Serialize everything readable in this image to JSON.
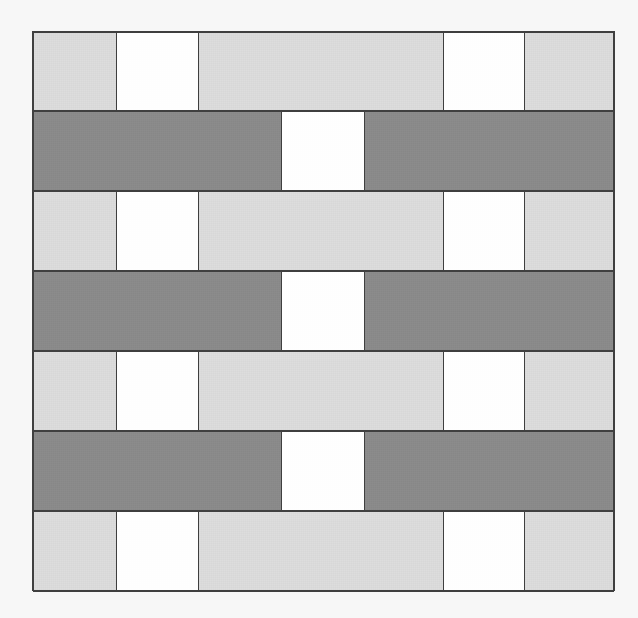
{
  "figure": {
    "type": "tiling-pattern-grid",
    "canvas_width": 638,
    "canvas_height": 618,
    "background_color": "#f7f7f7",
    "grid_left": 33,
    "grid_top": 32,
    "grid_width": 581,
    "grid_height": 560,
    "row_count": 7,
    "border_color": "#3f3f3f"
  },
  "palette": {
    "light_gray": "#dcdcdc",
    "dark_gray": "#8a8a8a",
    "white": "#ffffff",
    "outline": "#3f3f3f",
    "page_background": "#f7f7f7"
  },
  "legend": {
    "light_gray_label": "light gray tile",
    "dark_gray_label": "dark gray tile",
    "white_label": "white tile"
  },
  "rows": [
    {
      "index": 1,
      "band": "light",
      "cells": [
        {
          "fill": "light",
          "width_units": 84,
          "color": "#dcdcdc"
        },
        {
          "fill": "white",
          "width_units": 81,
          "color": "#ffffff"
        },
        {
          "fill": "light",
          "width_units": 246,
          "color": "#dcdcdc"
        },
        {
          "fill": "white",
          "width_units": 81,
          "color": "#ffffff"
        },
        {
          "fill": "light",
          "width_units": 89,
          "color": "#dcdcdc"
        }
      ]
    },
    {
      "index": 2,
      "band": "dark",
      "cells": [
        {
          "fill": "dark",
          "width_units": 249,
          "color": "#8a8a8a"
        },
        {
          "fill": "white",
          "width_units": 82,
          "color": "#ffffff"
        },
        {
          "fill": "dark",
          "width_units": 250,
          "color": "#8a8a8a"
        }
      ]
    },
    {
      "index": 3,
      "band": "light",
      "cells": [
        {
          "fill": "light",
          "width_units": 84,
          "color": "#dcdcdc"
        },
        {
          "fill": "white",
          "width_units": 81,
          "color": "#ffffff"
        },
        {
          "fill": "light",
          "width_units": 246,
          "color": "#dcdcdc"
        },
        {
          "fill": "white",
          "width_units": 81,
          "color": "#ffffff"
        },
        {
          "fill": "light",
          "width_units": 89,
          "color": "#dcdcdc"
        }
      ]
    },
    {
      "index": 4,
      "band": "dark",
      "cells": [
        {
          "fill": "dark",
          "width_units": 249,
          "color": "#8a8a8a"
        },
        {
          "fill": "white",
          "width_units": 82,
          "color": "#ffffff"
        },
        {
          "fill": "dark",
          "width_units": 250,
          "color": "#8a8a8a"
        }
      ]
    },
    {
      "index": 5,
      "band": "light",
      "cells": [
        {
          "fill": "light",
          "width_units": 84,
          "color": "#dcdcdc"
        },
        {
          "fill": "white",
          "width_units": 81,
          "color": "#ffffff"
        },
        {
          "fill": "light",
          "width_units": 246,
          "color": "#dcdcdc"
        },
        {
          "fill": "white",
          "width_units": 81,
          "color": "#ffffff"
        },
        {
          "fill": "light",
          "width_units": 89,
          "color": "#dcdcdc"
        }
      ]
    },
    {
      "index": 6,
      "band": "dark",
      "cells": [
        {
          "fill": "dark",
          "width_units": 249,
          "color": "#8a8a8a"
        },
        {
          "fill": "white",
          "width_units": 82,
          "color": "#ffffff"
        },
        {
          "fill": "dark",
          "width_units": 250,
          "color": "#8a8a8a"
        }
      ]
    },
    {
      "index": 7,
      "band": "light",
      "cells": [
        {
          "fill": "light",
          "width_units": 84,
          "color": "#dcdcdc"
        },
        {
          "fill": "white",
          "width_units": 81,
          "color": "#ffffff"
        },
        {
          "fill": "light",
          "width_units": 246,
          "color": "#dcdcdc"
        },
        {
          "fill": "white",
          "width_units": 81,
          "color": "#ffffff"
        },
        {
          "fill": "light",
          "width_units": 89,
          "color": "#dcdcdc"
        }
      ]
    }
  ]
}
